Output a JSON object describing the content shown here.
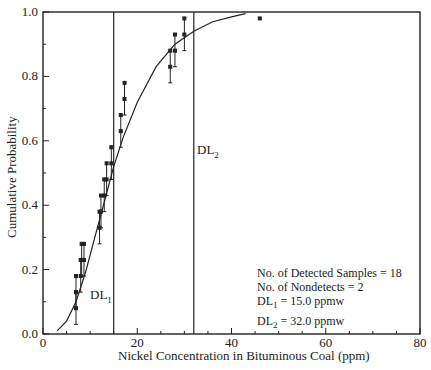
{
  "chart_data": {
    "type": "scatter",
    "title": "",
    "xlabel": "Nickel Concentration in Bituminous Coal (ppm)",
    "ylabel": "Cumulative Probability",
    "xlim": [
      0,
      80
    ],
    "ylim": [
      0.0,
      1.0
    ],
    "x_ticks": [
      "0",
      "20",
      "40",
      "60",
      "80"
    ],
    "y_ticks": [
      "0.0",
      "0.2",
      "0.4",
      "0.6",
      "0.8",
      "1.0"
    ],
    "grid": false,
    "series": [
      {
        "name": "Detected samples (with interval bars)",
        "points": [
          {
            "x": 7.0,
            "y": 0.08,
            "lo": 0.03,
            "hi": 0.13
          },
          {
            "x": 7.0,
            "y": 0.13,
            "lo": 0.08,
            "hi": 0.18
          },
          {
            "x": 8.0,
            "y": 0.18,
            "lo": 0.13,
            "hi": 0.23
          },
          {
            "x": 8.2,
            "y": 0.23,
            "lo": 0.18,
            "hi": 0.28
          },
          {
            "x": 8.7,
            "y": 0.23,
            "lo": 0.18,
            "hi": 0.28
          },
          {
            "x": 12.0,
            "y": 0.33,
            "lo": 0.28,
            "hi": 0.38
          },
          {
            "x": 12.3,
            "y": 0.38,
            "lo": 0.33,
            "hi": 0.43
          },
          {
            "x": 13.0,
            "y": 0.43,
            "lo": 0.38,
            "hi": 0.48
          },
          {
            "x": 13.5,
            "y": 0.48,
            "lo": 0.43,
            "hi": 0.53
          },
          {
            "x": 14.5,
            "y": 0.53,
            "lo": 0.48,
            "hi": 0.58
          },
          {
            "x": 16.5,
            "y": 0.63,
            "lo": 0.58,
            "hi": 0.68
          },
          {
            "x": 17.3,
            "y": 0.73,
            "lo": 0.68,
            "hi": 0.78
          },
          {
            "x": 27.0,
            "y": 0.83,
            "lo": 0.78,
            "hi": 0.88
          },
          {
            "x": 28.0,
            "y": 0.88,
            "lo": 0.83,
            "hi": 0.93
          },
          {
            "x": 30.0,
            "y": 0.93,
            "lo": 0.88,
            "hi": 0.98
          },
          {
            "x": 46.0,
            "y": 0.98,
            "lo": 0.98,
            "hi": 0.98
          }
        ]
      },
      {
        "name": "Fitted CDF",
        "type": "line",
        "x": [
          3,
          5,
          7,
          9,
          11,
          13,
          15,
          17,
          20,
          24,
          28,
          32,
          36,
          40,
          43
        ],
        "y": [
          0.01,
          0.04,
          0.1,
          0.19,
          0.3,
          0.41,
          0.52,
          0.61,
          0.72,
          0.83,
          0.9,
          0.94,
          0.97,
          0.985,
          0.995
        ]
      }
    ],
    "reference_lines": [
      {
        "x": 15.0,
        "label": "DL1"
      },
      {
        "x": 32.0,
        "label": "DL2"
      }
    ],
    "annotations": [
      "No. of Detected Samples = 18",
      "No. of Nondetects = 2",
      "DL1 = 15.0 ppmw",
      "DL2 = 32.0 ppmw"
    ]
  },
  "labels": {
    "xlabel": "Nickel Concentration in Bituminous Coal (ppm)",
    "ylabel": "Cumulative Probability",
    "x_ticks": [
      "0",
      "20",
      "40",
      "60",
      "80"
    ],
    "y_ticks": [
      "1.0",
      "0.8",
      "0.6",
      "0.4",
      "0.2",
      "0.0"
    ],
    "dl1": "DL",
    "dl1_sub": "1",
    "dl2": "DL",
    "dl2_sub": "2",
    "annot_line1": "No. of Detected Samples = 18",
    "annot_line2": "No. of Nondetects = 2",
    "annot_dl1_pre": "DL",
    "annot_dl1_sub": "1",
    "annot_dl1_post": " = 15.0 ppmw",
    "annot_dl2_pre": "DL",
    "annot_dl2_sub": "2",
    "annot_dl2_post": " = 32.0 ppmw"
  }
}
